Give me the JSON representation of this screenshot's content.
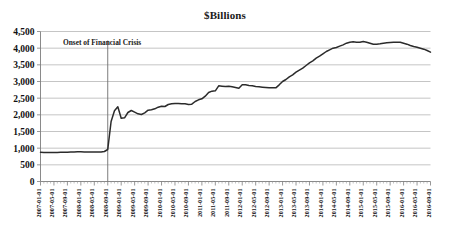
{
  "chart_data": {
    "type": "line",
    "title": "$Billions",
    "xlabel": "",
    "ylabel": "",
    "ylim": [
      0,
      4500
    ],
    "ytick_step": 500,
    "grid": true,
    "legend": null,
    "yticks": [
      "0",
      "500",
      "1,000",
      "1,500",
      "2,000",
      "2,500",
      "3,000",
      "3,500",
      "4,000",
      "4,500"
    ],
    "annotations": [
      {
        "text": "Onset of Financial Crisis",
        "x": "2008-09-01",
        "type": "vertical-line-with-label"
      }
    ],
    "xticks": [
      "2007-01-01",
      "2007-05-01",
      "2007-09-01",
      "2008-01-01",
      "2008-05-01",
      "2008-09-01",
      "2009-01-01",
      "2009-05-01",
      "2009-09-01",
      "2010-01-01",
      "2010-05-01",
      "2010-09-01",
      "2011-01-01",
      "2011-05-01",
      "2011-09-01",
      "2012-01-01",
      "2012-05-01",
      "2012-09-01",
      "2013-01-01",
      "2013-05-01",
      "2013-09-01",
      "2014-01-01",
      "2014-05-01",
      "2014-09-01",
      "2015-01-01",
      "2015-05-01",
      "2015-09-01",
      "2016-01-01",
      "2016-05-01",
      "2016-09-01"
    ],
    "x": [
      "2007-01-01",
      "2007-02-01",
      "2007-03-01",
      "2007-04-01",
      "2007-05-01",
      "2007-06-01",
      "2007-07-01",
      "2007-08-01",
      "2007-09-01",
      "2007-10-01",
      "2007-11-01",
      "2007-12-01",
      "2008-01-01",
      "2008-02-01",
      "2008-03-01",
      "2008-04-01",
      "2008-05-01",
      "2008-06-01",
      "2008-07-01",
      "2008-08-01",
      "2008-09-01",
      "2008-10-01",
      "2008-11-01",
      "2008-12-01",
      "2009-01-01",
      "2009-02-01",
      "2009-03-01",
      "2009-04-01",
      "2009-05-01",
      "2009-06-01",
      "2009-07-01",
      "2009-08-01",
      "2009-09-01",
      "2009-10-01",
      "2009-11-01",
      "2009-12-01",
      "2010-01-01",
      "2010-02-01",
      "2010-03-01",
      "2010-04-01",
      "2010-05-01",
      "2010-06-01",
      "2010-07-01",
      "2010-08-01",
      "2010-09-01",
      "2010-10-01",
      "2010-11-01",
      "2010-12-01",
      "2011-01-01",
      "2011-02-01",
      "2011-03-01",
      "2011-04-01",
      "2011-05-01",
      "2011-06-01",
      "2011-07-01",
      "2011-08-01",
      "2011-09-01",
      "2011-10-01",
      "2011-11-01",
      "2011-12-01",
      "2012-01-01",
      "2012-02-01",
      "2012-03-01",
      "2012-04-01",
      "2012-05-01",
      "2012-06-01",
      "2012-07-01",
      "2012-08-01",
      "2012-09-01",
      "2012-10-01",
      "2012-11-01",
      "2012-12-01",
      "2013-01-01",
      "2013-02-01",
      "2013-03-01",
      "2013-04-01",
      "2013-05-01",
      "2013-06-01",
      "2013-07-01",
      "2013-08-01",
      "2013-09-01",
      "2013-10-01",
      "2013-11-01",
      "2013-12-01",
      "2014-01-01",
      "2014-02-01",
      "2014-03-01",
      "2014-04-01",
      "2014-05-01",
      "2014-06-01",
      "2014-07-01",
      "2014-08-01",
      "2014-09-01",
      "2014-10-01",
      "2014-11-01",
      "2014-12-01",
      "2015-01-01",
      "2015-02-01",
      "2015-03-01",
      "2015-04-01",
      "2015-05-01",
      "2015-06-01",
      "2015-07-01",
      "2015-08-01",
      "2015-09-01",
      "2015-10-01",
      "2015-11-01",
      "2015-12-01",
      "2016-01-01",
      "2016-02-01",
      "2016-03-01",
      "2016-04-01",
      "2016-05-01",
      "2016-06-01",
      "2016-07-01",
      "2016-08-01",
      "2016-09-01"
    ],
    "values": [
      875,
      872,
      870,
      868,
      870,
      872,
      874,
      876,
      880,
      882,
      885,
      890,
      890,
      888,
      886,
      885,
      884,
      885,
      888,
      900,
      960,
      1800,
      2120,
      2240,
      1900,
      1910,
      2070,
      2130,
      2080,
      2030,
      2010,
      2060,
      2140,
      2150,
      2180,
      2230,
      2260,
      2250,
      2310,
      2330,
      2340,
      2340,
      2330,
      2330,
      2310,
      2320,
      2400,
      2450,
      2480,
      2560,
      2670,
      2710,
      2720,
      2870,
      2860,
      2850,
      2860,
      2840,
      2820,
      2800,
      2900,
      2900,
      2880,
      2870,
      2850,
      2840,
      2830,
      2820,
      2810,
      2810,
      2810,
      2900,
      3000,
      3060,
      3140,
      3200,
      3280,
      3340,
      3400,
      3480,
      3560,
      3620,
      3700,
      3760,
      3830,
      3900,
      3950,
      4000,
      4020,
      4060,
      4100,
      4150,
      4180,
      4190,
      4180,
      4180,
      4200,
      4180,
      4150,
      4120,
      4120,
      4130,
      4150,
      4160,
      4170,
      4180,
      4180,
      4180,
      4150,
      4120,
      4080,
      4050,
      4030,
      4000,
      3970,
      3930,
      3880
    ]
  }
}
